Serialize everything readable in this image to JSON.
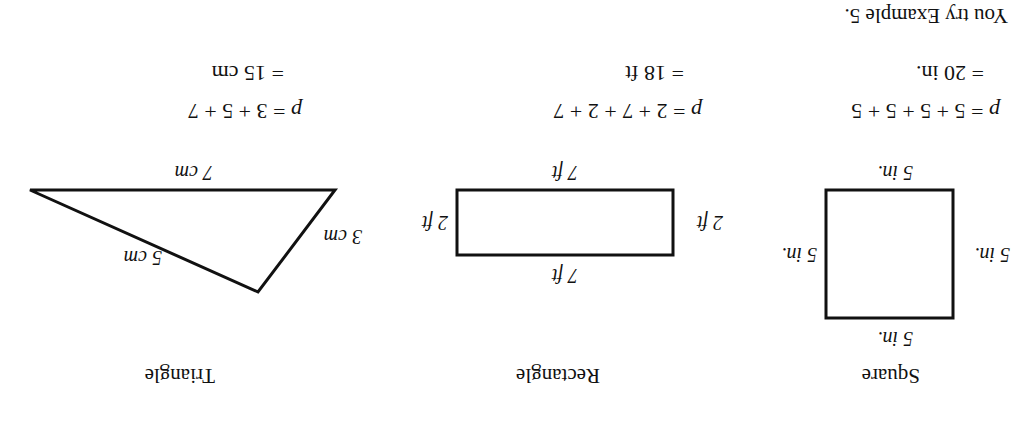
{
  "orientation": "rotated 180 degrees",
  "figures": [
    {
      "name": "Square",
      "caption": "Square",
      "side_labels": {
        "top": "5 in.",
        "bottom": "5 in.",
        "left": "5 in.",
        "right": "5 in."
      },
      "equation": {
        "var": "p",
        "line1": "= 5 + 5 + 5 + 5",
        "line2": "= 20 in."
      }
    },
    {
      "name": "Rectangle",
      "caption": "Rectangle",
      "side_labels": {
        "top": "7 ft",
        "bottom": "7 ft",
        "left": "2 ft",
        "right": "2 ft"
      },
      "equation": {
        "var": "p",
        "line1": "= 2 + 7 + 2 + 7",
        "line2": "= 18 ft"
      }
    },
    {
      "name": "Triangle",
      "caption": "Triangle",
      "side_labels": {
        "left": "3 cm",
        "right": "5 cm",
        "bottom": "7 cm"
      },
      "equation": {
        "var": "p",
        "line1": "= 3 + 5 + 7",
        "line2": "= 15 cm"
      }
    }
  ],
  "prompt": "You try Example 5."
}
